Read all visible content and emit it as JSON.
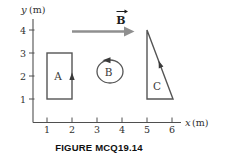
{
  "figure": {
    "caption": "FIGURE MCQ19.14",
    "axes": {
      "x_var": "x",
      "x_unit": "(m)",
      "y_var": "y",
      "y_unit": "(m)",
      "x_ticks": [
        "1",
        "2",
        "3",
        "4",
        "5",
        "6"
      ],
      "y_ticks": [
        "4",
        "3",
        "2",
        "1"
      ]
    },
    "field": {
      "symbol": "B",
      "direction": "right"
    },
    "loops": [
      {
        "label": "A",
        "shape": "rectangle",
        "x_range_m": [
          1,
          2
        ],
        "y_range_m": [
          1,
          3
        ],
        "arrow": "counterclockwise"
      },
      {
        "label": "B",
        "shape": "circle",
        "center_m": [
          3.5,
          2.2
        ],
        "radius_m": 0.5,
        "arrow": "counterclockwise"
      },
      {
        "label": "C",
        "shape": "right-triangle",
        "vertices_m": [
          [
            5,
            4
          ],
          [
            5,
            1
          ],
          [
            6,
            1
          ]
        ],
        "arrow": "counterclockwise"
      }
    ],
    "colors": {
      "stroke": "#4f4f4f",
      "field_arrow": "#8f8f8f",
      "text": "#2f2f2f",
      "caption": "#101010"
    }
  }
}
